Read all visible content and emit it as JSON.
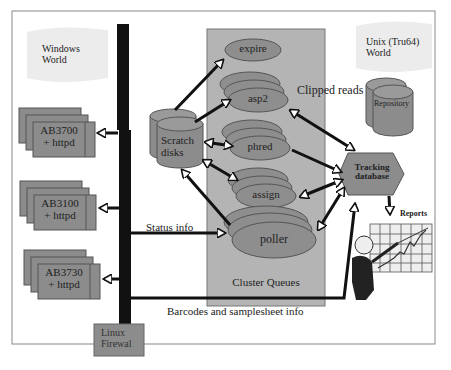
{
  "worlds": {
    "windows": {
      "line1": "Windows",
      "line2": "World"
    },
    "unix": {
      "line1": "Unix (Tru64)",
      "line2": "World"
    }
  },
  "instruments": [
    {
      "line1": "AB3700",
      "line2": "+ httpd"
    },
    {
      "line1": "AB3100",
      "line2": "+ httpd"
    },
    {
      "line1": "AB3730",
      "line2": "+ httpd"
    }
  ],
  "firewall": {
    "line1": "Linux",
    "line2": "Firewal"
  },
  "scratch": {
    "line1": "Scratch",
    "line2": "disks"
  },
  "cluster": {
    "label": "Cluster Queues",
    "queues": [
      "expire",
      "asp2",
      "phred",
      "assign",
      "poller"
    ]
  },
  "repository": {
    "label": "Repository"
  },
  "tracking": {
    "line1": "Tracking",
    "line2": "database"
  },
  "reports": {
    "label": "Reports"
  },
  "edges": {
    "clipped_reads": "Clipped reads",
    "status_info": "Status info",
    "barcodes": "Barcodes and samplesheet info"
  },
  "colors": {
    "box_fill": "#8c8c8c",
    "cluster_fill": "#b4b4b4",
    "ellipse_fill": "#8e8e8e",
    "world_fill": "#ececec",
    "firewall_bar": "#111111",
    "border": "#6a6a6a"
  }
}
